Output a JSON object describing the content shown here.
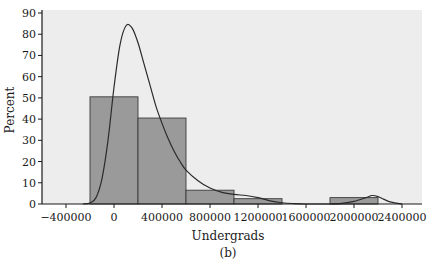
{
  "chart_data": {
    "type": "bar",
    "subtype": "histogram-with-density",
    "title": "",
    "caption": "(b)",
    "xlabel": "Undergrads",
    "ylabel": "Percent",
    "xlim": [
      -600000,
      2600000
    ],
    "ylim": [
      0,
      90
    ],
    "x_ticks": [
      -400000,
      0,
      400000,
      800000,
      1200000,
      1600000,
      2000000,
      2400000
    ],
    "x_tick_labels": [
      "−400000",
      "0",
      "400000",
      "800000",
      "1200000",
      "1600000",
      "2000000",
      "2400000"
    ],
    "y_ticks": [
      0,
      10,
      20,
      30,
      40,
      50,
      60,
      70,
      80,
      90
    ],
    "y_tick_labels": [
      "0",
      "10",
      "20",
      "30",
      "40",
      "50",
      "60",
      "70",
      "80",
      "90"
    ],
    "bins": [
      {
        "x0": -200000,
        "x1": 200000,
        "value": 50.5
      },
      {
        "x0": 200000,
        "x1": 600000,
        "value": 40.5
      },
      {
        "x0": 600000,
        "x1": 1000000,
        "value": 6.5
      },
      {
        "x0": 1000000,
        "x1": 1400000,
        "value": 2.5
      },
      {
        "x0": 1800000,
        "x1": 2200000,
        "value": 3
      }
    ],
    "density_curve": {
      "x": [
        -260000,
        -200000,
        -150000,
        -100000,
        -50000,
        0,
        50000,
        100000,
        150000,
        200000,
        250000,
        300000,
        350000,
        400000,
        450000,
        500000,
        550000,
        600000,
        700000,
        800000,
        900000,
        1000000,
        1100000,
        1200000,
        1300000,
        1400000,
        1500000,
        1600000,
        1700000,
        1800000,
        1900000,
        2000000,
        2100000,
        2150000,
        2200000,
        2250000,
        2300000,
        2400000
      ],
      "y": [
        0,
        0.5,
        3,
        12,
        30,
        55,
        75,
        84,
        83,
        76,
        66,
        56,
        46,
        38,
        31,
        25,
        20,
        16,
        11,
        7.5,
        5.5,
        4.5,
        4,
        3,
        1.5,
        0.6,
        0.2,
        0,
        0,
        0,
        0.3,
        1.2,
        3,
        4,
        3.5,
        2.2,
        1,
        0
      ]
    },
    "grid": false,
    "legend": "none",
    "colors": {
      "plot_background": "#ededed",
      "bar_fill": "#9a9a9a",
      "bar_edge": "#3a3a3a",
      "curve": "#2b2b2b",
      "axis": "#1a1a1a"
    }
  }
}
